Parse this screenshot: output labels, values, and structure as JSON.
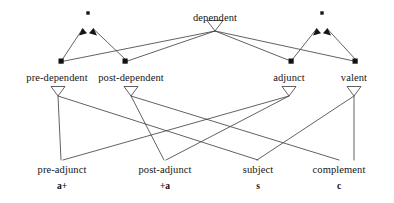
{
  "diagram": {
    "type": "lattice-diagram",
    "stroke_color": "#3a3a3a",
    "marker_color": "#111111",
    "text_color": "#141414",
    "nodes": {
      "top": {
        "label": "dependent",
        "x": 215,
        "y": 19
      },
      "level2": [
        {
          "label": "pre-dependent",
          "x": 57,
          "y": 80
        },
        {
          "label": "post-dependent",
          "x": 131,
          "y": 80
        },
        {
          "label": "adjunct",
          "x": 289,
          "y": 80
        },
        {
          "label": "valent",
          "x": 354,
          "y": 80
        }
      ],
      "level3": [
        {
          "label": "pre-adjunct",
          "feature": "a+",
          "x": 62,
          "y": 173
        },
        {
          "label": "post-adjunct",
          "feature": "+a",
          "x": 165,
          "y": 173
        },
        {
          "label": "subject",
          "feature": "s",
          "x": 258,
          "y": 173
        },
        {
          "label": "complement",
          "feature": "c",
          "x": 339,
          "y": 173
        }
      ]
    },
    "decorations": {
      "left_join_dot": {
        "x": 88,
        "y": 13
      },
      "right_join_dot": {
        "x": 322,
        "y": 13
      },
      "arrowhead_count": 4,
      "square_marker_count": 4,
      "hollow_triangle_count": 7
    }
  }
}
